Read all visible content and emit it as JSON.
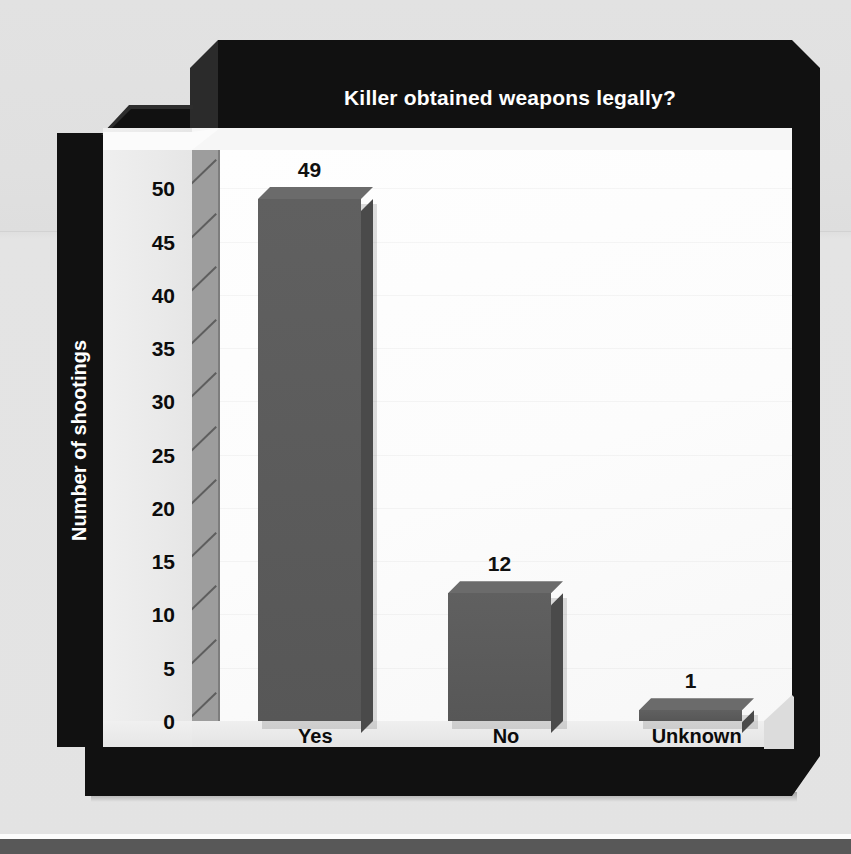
{
  "chart_data": {
    "type": "bar",
    "title": "Killer obtained weapons legally?",
    "xlabel": "",
    "ylabel": "Number of shootings",
    "categories": [
      "Yes",
      "No",
      "Unknown"
    ],
    "values": [
      49,
      12,
      1
    ],
    "value_labels": [
      "49",
      "12",
      "1"
    ],
    "ylim": [
      0,
      50
    ],
    "ytick_labels": [
      "0",
      "5",
      "10",
      "15",
      "20",
      "25",
      "30",
      "35",
      "40",
      "45",
      "50"
    ],
    "ytick_values": [
      0,
      5,
      10,
      15,
      20,
      25,
      30,
      35,
      40,
      45,
      50
    ],
    "grid": false,
    "legend": "none",
    "style": "3d-bar",
    "colors": {
      "bar_face": "#5c5c5c",
      "bar_top": "#6b6b6b",
      "bar_side": "#4a4a4a",
      "frame": "#111111",
      "title_text": "#ffffff",
      "plot_background": "#fdfdfd",
      "axis_wall": "#eaeaea",
      "axis_wall_side": "#9d9d9d",
      "page_background": "#e2e2e2"
    }
  }
}
